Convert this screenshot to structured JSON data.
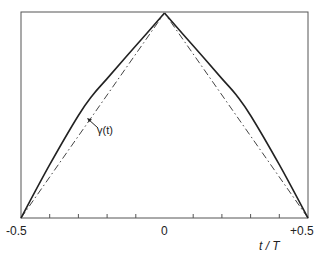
{
  "chart_data": {
    "type": "line",
    "title": "",
    "xlabel": "t / T",
    "ylabel": "",
    "xlim": [
      -0.5,
      0.5
    ],
    "ylim": [
      0,
      1
    ],
    "grid": false,
    "legend": null,
    "x_tick_labels": [
      "-0.5",
      "0",
      "+0.5"
    ],
    "x_minor_ticks": [
      -0.4,
      -0.3,
      -0.2,
      -0.1,
      0.1,
      0.2,
      0.3,
      0.4
    ],
    "series": [
      {
        "name": "gamma_curve",
        "style": "solid",
        "x": [
          -0.5,
          -0.4,
          -0.3,
          -0.25,
          -0.2,
          -0.1,
          0,
          0.1,
          0.2,
          0.25,
          0.3,
          0.4,
          0.5
        ],
        "y": [
          0,
          0.26,
          0.5,
          0.6,
          0.68,
          0.84,
          1,
          0.84,
          0.68,
          0.6,
          0.5,
          0.26,
          0
        ]
      },
      {
        "name": "triangle_reference",
        "style": "dash-dot",
        "x": [
          -0.5,
          0,
          0.5
        ],
        "y": [
          0,
          1,
          0
        ]
      }
    ],
    "annotations": [
      {
        "text": "γ(t)",
        "points_to": "triangle_reference",
        "x": -0.26,
        "y": 0.48
      }
    ]
  },
  "labels": {
    "tick_left": "-0.5",
    "tick_mid": "0",
    "tick_right": "+0.5",
    "xlabel": "t / T",
    "annotation": "γ(t)"
  }
}
